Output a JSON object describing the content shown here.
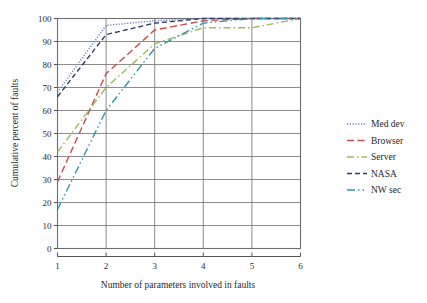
{
  "chart_data": {
    "type": "line",
    "title": "",
    "xlabel": "Number of parameters involved in faults",
    "ylabel": "Cumulative percent of faults",
    "x": [
      1,
      2,
      3,
      4,
      5,
      6
    ],
    "xlim": [
      1,
      6
    ],
    "ylim": [
      0,
      100
    ],
    "xticks": [
      "1",
      "2",
      "3",
      "4",
      "5",
      "6"
    ],
    "yticks": [
      "0",
      "10",
      "20",
      "30",
      "40",
      "50",
      "60",
      "70",
      "80",
      "90",
      "100"
    ],
    "grid": true,
    "legend_position": "right",
    "series": [
      {
        "name": "Med dev",
        "color": "#6f7fc4",
        "dash": "dotted",
        "dasharray": "1.2,1.6",
        "values": [
          68,
          97,
          99,
          100,
          100,
          100
        ]
      },
      {
        "name": "Browser",
        "color": "#c0504d",
        "dash": "dashed",
        "dasharray": "7,3.5",
        "values": [
          29,
          76,
          95,
          99,
          100,
          100
        ]
      },
      {
        "name": "Server",
        "color": "#9bbb59",
        "dash": "dash-dot",
        "dasharray": "7,3,1.5,3",
        "values": [
          42,
          70,
          89,
          96,
          96,
          100
        ]
      },
      {
        "name": "NASA",
        "color": "#2f3c66",
        "dash": "dashed",
        "dasharray": "5,3",
        "values": [
          66,
          93,
          98,
          100,
          100,
          100
        ]
      },
      {
        "name": "NW sec",
        "color": "#3a93a5",
        "dash": "dash-dot-dot",
        "dasharray": "8,3,1.5,3,1.5,3",
        "values": [
          17,
          60,
          87,
          98,
          100,
          100
        ]
      }
    ]
  },
  "axes": {
    "y_title": "Cumulative percent of faults",
    "x_title": "Number of parameters involved in faults",
    "y_tick_labels": [
      "100",
      "90",
      "80",
      "70",
      "60",
      "50",
      "40",
      "30",
      "20",
      "10",
      "0"
    ],
    "x_tick_labels": [
      "1",
      "2",
      "3",
      "4",
      "5",
      "6"
    ]
  },
  "legend": {
    "items": [
      {
        "label": "Med dev",
        "color": "#6f7fc4"
      },
      {
        "label": "Browser",
        "color": "#c0504d"
      },
      {
        "label": "Server",
        "color": "#9bbb59"
      },
      {
        "label": "NASA",
        "color": "#2f3c66"
      },
      {
        "label": "NW sec",
        "color": "#3a93a5"
      }
    ]
  },
  "colors": {
    "axis": "#555555",
    "grid": "#6e6e6e",
    "text": "#1f1f1f",
    "background": "#ffffff"
  }
}
